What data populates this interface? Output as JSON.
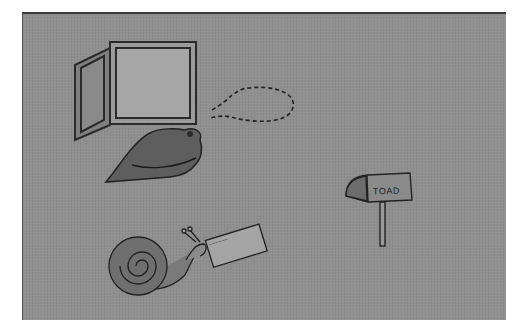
{
  "scene": {
    "description": "Photograph of hand-drawn paper cutouts on a gray felt board",
    "background_color": "#8f8f8f",
    "items": [
      {
        "name": "open-window",
        "label": ""
      },
      {
        "name": "thought-bubble",
        "label": ""
      },
      {
        "name": "frog",
        "label": ""
      },
      {
        "name": "mailbox",
        "label": "TOAD"
      },
      {
        "name": "snail",
        "label": ""
      },
      {
        "name": "letter-card",
        "label": "~~~~~~"
      }
    ]
  }
}
